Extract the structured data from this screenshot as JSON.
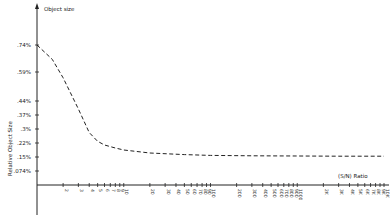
{
  "chart_data": {
    "type": "line",
    "title": "",
    "xlabel": "(S/N) Ratio",
    "ylabel": "Relative Object Size",
    "y_axis_top_label": "Object size",
    "x_scale": "log",
    "xlim": [
      1,
      10000
    ],
    "y_ticks": [
      {
        "label": ".74%",
        "value": 0.74
      },
      {
        "label": ".59%",
        "value": 0.59
      },
      {
        "label": ".44%",
        "value": 0.44
      },
      {
        "label": ".37%",
        "value": 0.37
      },
      {
        "label": ".3%",
        "value": 0.3
      },
      {
        "label": ".22%",
        "value": 0.22
      },
      {
        "label": ".15%",
        "value": 0.15
      },
      {
        "label": ".074%",
        "value": 0.074
      }
    ],
    "x_ticks": [
      "2",
      "3",
      "4",
      "5",
      "6",
      "7",
      "8",
      "9",
      "10",
      "20",
      "30",
      "40",
      "50",
      "60",
      "70",
      "80",
      "90",
      "100",
      "200",
      "300",
      "400",
      "500",
      "600",
      "700",
      "800",
      "900",
      "1000",
      "2K",
      "3K",
      "4K",
      "5K",
      "6K",
      "7K",
      "8K",
      "9K",
      "10K"
    ],
    "grid": false,
    "legend": null,
    "series": [
      {
        "name": "Relative Object Size",
        "style": "dashed",
        "x": [
          1,
          1.5,
          2,
          3,
          4,
          5,
          6,
          8,
          10,
          20,
          50,
          100,
          300,
          1000,
          3000,
          10000
        ],
        "y": [
          0.74,
          0.66,
          0.56,
          0.4,
          0.28,
          0.23,
          0.21,
          0.195,
          0.185,
          0.17,
          0.162,
          0.158,
          0.156,
          0.155,
          0.154,
          0.154
        ]
      }
    ]
  }
}
